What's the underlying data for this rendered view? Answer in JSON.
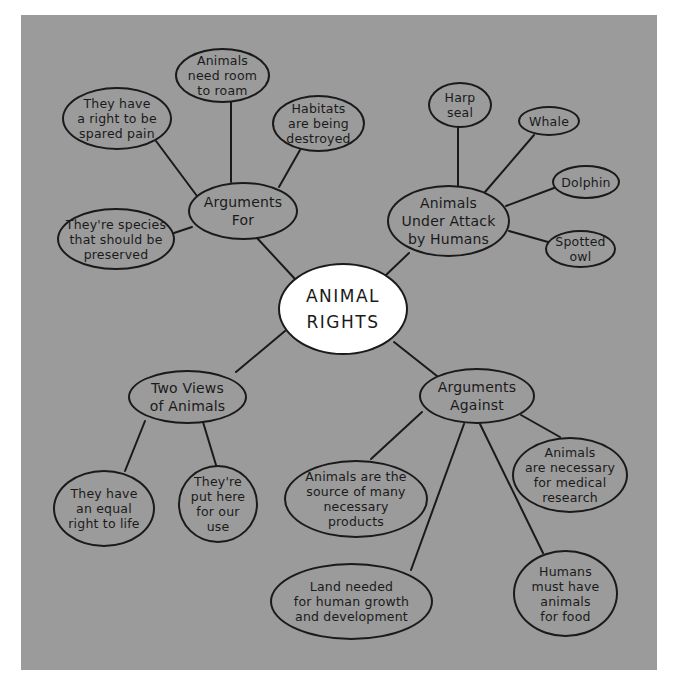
{
  "diagram": {
    "type": "mind-map",
    "background_color": "#9b9b9b",
    "root": {
      "id": "root",
      "label": "ANIMAL\nRIGHTS"
    },
    "hubs": [
      {
        "id": "arguments-for",
        "label": "Arguments\nFor",
        "children": [
          {
            "id": "spared-pain",
            "label": "They have\na right to be\nspared pain"
          },
          {
            "id": "room-to-roam",
            "label": "Animals\nneed room\nto roam"
          },
          {
            "id": "habitats",
            "label": "Habitats\nare being\ndestroyed"
          },
          {
            "id": "species-preserved",
            "label": "They're species\nthat should be\npreserved"
          }
        ]
      },
      {
        "id": "under-attack",
        "label": "Animals\nUnder Attack\nby Humans",
        "children": [
          {
            "id": "harp-seal",
            "label": "Harp\nseal"
          },
          {
            "id": "whale",
            "label": "Whale"
          },
          {
            "id": "dolphin",
            "label": "Dolphin"
          },
          {
            "id": "spotted-owl",
            "label": "Spotted\nowl"
          }
        ]
      },
      {
        "id": "two-views",
        "label": "Two Views\nof Animals",
        "children": [
          {
            "id": "equal-right",
            "label": "They have\nan equal\nright to life"
          },
          {
            "id": "our-use",
            "label": "They're\nput here\nfor our\nuse"
          }
        ]
      },
      {
        "id": "arguments-against",
        "label": "Arguments\nAgainst",
        "children": [
          {
            "id": "products",
            "label": "Animals are the\nsource of many\nnecessary\nproducts"
          },
          {
            "id": "medical",
            "label": "Animals\nare necessary\nfor medical\nresearch"
          },
          {
            "id": "land",
            "label": "Land needed\nfor human growth\nand development"
          },
          {
            "id": "food",
            "label": "Humans\nmust have\nanimals\nfor food"
          }
        ]
      }
    ]
  }
}
